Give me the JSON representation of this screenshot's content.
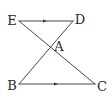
{
  "diagram": {
    "type": "geometry",
    "stroke_color": "#333333",
    "points": {
      "E": {
        "label": "E",
        "x": 19,
        "y": 21,
        "label_x": 12,
        "label_y": 20
      },
      "D": {
        "label": "D",
        "x": 73,
        "y": 21,
        "label_x": 80,
        "label_y": 19
      },
      "A": {
        "label": "A",
        "x": 49,
        "y": 47,
        "label_x": 59,
        "label_y": 46
      },
      "B": {
        "label": "B",
        "x": 19,
        "y": 84,
        "label_x": 12,
        "label_y": 85
      },
      "C": {
        "label": "C",
        "x": 95,
        "y": 84,
        "label_x": 102,
        "label_y": 86
      }
    },
    "segments": [
      {
        "from": "E",
        "to": "D",
        "parallel_marker": true,
        "marker_x": 45
      },
      {
        "from": "B",
        "to": "C",
        "parallel_marker": true,
        "marker_x": 56
      },
      {
        "from": "E",
        "to": "C",
        "parallel_marker": false
      },
      {
        "from": "D",
        "to": "B",
        "parallel_marker": false
      }
    ]
  }
}
